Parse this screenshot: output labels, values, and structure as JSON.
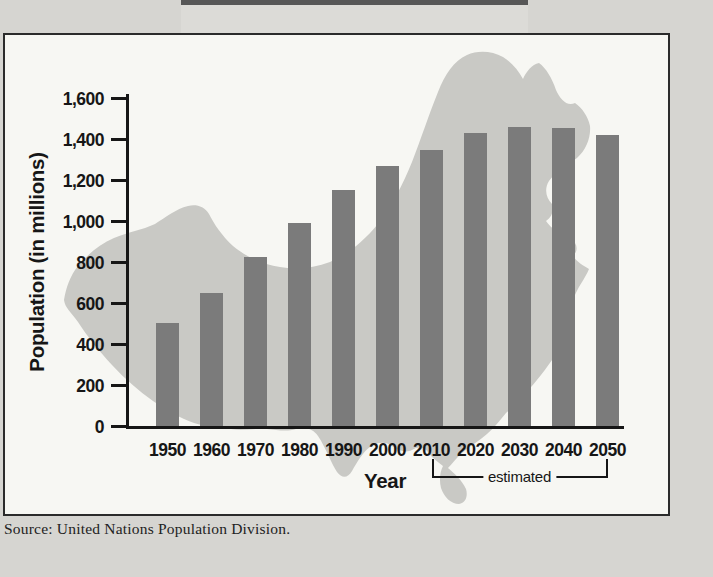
{
  "figure": {
    "source_note": "Source: United Nations Population Division.",
    "colors": {
      "page_background": "#d6d5d1",
      "banner_fill": "#dcdbd7",
      "banner_edge": "#575757",
      "box_border": "#2b2b2b",
      "chart_background": "#f7f7f3",
      "map_fill": "#c9c9c5",
      "bar_fill": "#7b7b7b",
      "axis_ink": "#161616"
    }
  },
  "chart_data": {
    "type": "bar",
    "title": "",
    "xlabel": "Year",
    "ylabel": "Population (in millions)",
    "categories": [
      "1950",
      "1960",
      "1970",
      "1980",
      "1990",
      "2000",
      "2010",
      "2020",
      "2030",
      "2040",
      "2050"
    ],
    "values": [
      510,
      655,
      830,
      1000,
      1160,
      1275,
      1355,
      1435,
      1465,
      1460,
      1425
    ],
    "estimated_categories": [
      "2010",
      "2020",
      "2030",
      "2040",
      "2050"
    ],
    "annotation": {
      "label": "estimated",
      "from": "2010",
      "to": "2050"
    },
    "ylim": [
      0,
      1600
    ],
    "ytick_interval": 200,
    "ytick_labels": [
      "0",
      "200",
      "400",
      "600",
      "800",
      "1,000",
      "1,200",
      "1,400",
      "1,600"
    ],
    "grid": false,
    "legend": "none",
    "background_image": "china-map-silhouette"
  }
}
